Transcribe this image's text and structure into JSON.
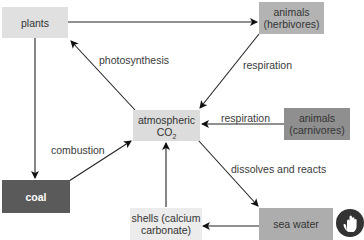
{
  "diagram": {
    "nodes": [
      {
        "id": "plants",
        "label": "plants",
        "fill": "#e0e0e0",
        "text_color": "#333333"
      },
      {
        "id": "herbivores",
        "line1": "animals",
        "line2": "(herbivores)",
        "fill": "#b3b3b3",
        "text_color": "#333333"
      },
      {
        "id": "co2",
        "line1": "atmospheric",
        "line2": "CO",
        "sub": "2",
        "fill": "#dcdcdc",
        "text_color": "#333333"
      },
      {
        "id": "carnivores",
        "line1": "animals",
        "line2": "(carnivores)",
        "fill": "#8f8f8f",
        "text_color": "#333333"
      },
      {
        "id": "coal",
        "label": "coal",
        "fill": "#5a5a5a",
        "text_color": "#ffffff"
      },
      {
        "id": "shells",
        "line1": "shells (calcium",
        "line2": "carbonate)",
        "fill": "#ececec",
        "text_color": "#333333"
      },
      {
        "id": "sea_water",
        "label": "sea water",
        "fill": "#adadad",
        "text_color": "#333333"
      }
    ],
    "edges": [
      {
        "from": "plants",
        "to": "herbivores",
        "label": ""
      },
      {
        "from": "co2",
        "to": "plants",
        "label": "photosynthesis"
      },
      {
        "from": "herbivores",
        "to": "co2",
        "label": "respiration"
      },
      {
        "from": "carnivores",
        "to": "co2",
        "label": "respiration"
      },
      {
        "from": "plants",
        "to": "coal",
        "label": ""
      },
      {
        "from": "coal",
        "to": "co2",
        "label": "combustion"
      },
      {
        "from": "co2",
        "to": "sea_water",
        "label": "dissolves and reacts"
      },
      {
        "from": "shells",
        "to": "co2",
        "label": ""
      },
      {
        "from": "sea_water",
        "to": "shells",
        "label": ""
      }
    ],
    "edge_labels": {
      "photosynthesis": "photosynthesis",
      "respiration_herb": "respiration",
      "respiration_carn": "respiration",
      "combustion": "combustion",
      "dissolves": "dissolves and reacts"
    },
    "cursor_icon": "hand-pointer-icon"
  }
}
